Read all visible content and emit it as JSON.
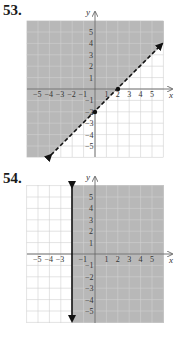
{
  "problems": [
    {
      "number": "53.",
      "type": "linear-inequality-graph",
      "boundary": "y = x - 2",
      "boundary_style": "dashed",
      "shaded_side": "above-left",
      "points": [
        [
          0,
          -2
        ],
        [
          2,
          0
        ]
      ]
    },
    {
      "number": "54.",
      "type": "linear-inequality-graph",
      "boundary": "x = -2",
      "boundary_style": "solid",
      "shaded_side": "right"
    }
  ],
  "axes": {
    "x_label": "x",
    "y_label": "y",
    "x_ticks_53": [
      "-5",
      "-4",
      "-3",
      "-2",
      "-1",
      "1",
      "2",
      "3",
      "4",
      "5"
    ],
    "y_ticks_53": [
      "5",
      "4",
      "3",
      "2",
      "1",
      "-1",
      "-2",
      "-3",
      "-4",
      "-5"
    ],
    "x_ticks_54": [
      "-5",
      "-4",
      "-3",
      "-1",
      "1",
      "2",
      "3",
      "4",
      "5"
    ],
    "y_ticks_54": [
      "5",
      "4",
      "3",
      "2",
      "1",
      "-1",
      "-2",
      "-3",
      "-4",
      "-5"
    ]
  },
  "chart_data": [
    {
      "type": "line",
      "title": "53.",
      "xlabel": "x",
      "ylabel": "y",
      "xlim": [
        -6,
        6
      ],
      "ylim": [
        -6,
        6
      ],
      "grid": true,
      "series": [
        {
          "name": "boundary y = x - 2 (dashed)",
          "x": [
            -4,
            6
          ],
          "y": [
            -6,
            4
          ]
        }
      ],
      "marked_points": [
        {
          "x": 0,
          "y": -2
        },
        {
          "x": 2,
          "y": 0
        }
      ],
      "shaded_region": "y > x - 2",
      "x_tick_labels": [
        "-5",
        "-4",
        "-3",
        "-2",
        "-1",
        "1",
        "2",
        "3",
        "4",
        "5"
      ],
      "y_tick_labels": [
        "-5",
        "-4",
        "-3",
        "-2",
        "-1",
        "1",
        "2",
        "3",
        "4",
        "5"
      ]
    },
    {
      "type": "line",
      "title": "54.",
      "xlabel": "x",
      "ylabel": "y",
      "xlim": [
        -6,
        6
      ],
      "ylim": [
        -6,
        6
      ],
      "grid": true,
      "series": [
        {
          "name": "boundary x = -2 (solid)",
          "x": [
            -2,
            -2
          ],
          "y": [
            -6,
            6
          ]
        }
      ],
      "shaded_region": "x >= -2",
      "x_tick_labels": [
        "-5",
        "-4",
        "-3",
        "-1",
        "1",
        "2",
        "3",
        "4",
        "5"
      ],
      "y_tick_labels": [
        "-5",
        "-4",
        "-3",
        "-2",
        "-1",
        "1",
        "2",
        "3",
        "4",
        "5"
      ]
    }
  ]
}
